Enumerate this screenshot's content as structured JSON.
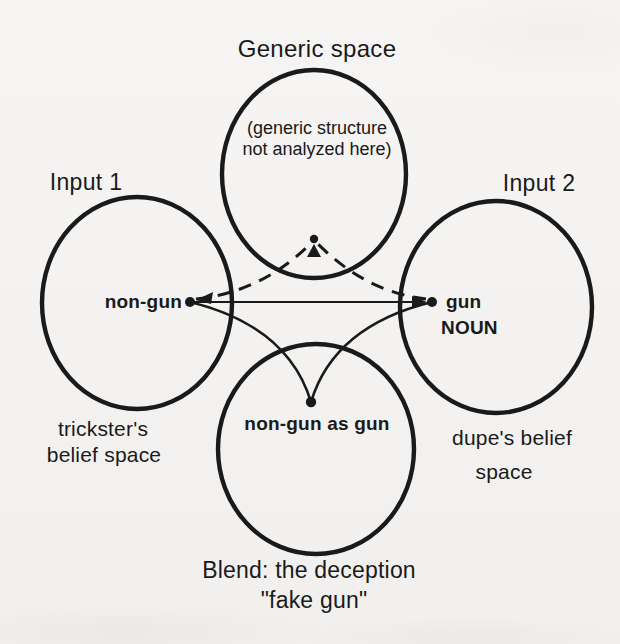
{
  "figure": {
    "background_color": "#f4f3f1",
    "ink_color": "#1a1a1a",
    "generic_space": {
      "title": "Generic space",
      "note_line1": "(generic structure",
      "note_line2": "not analyzed here)"
    },
    "input1": {
      "title": "Input 1",
      "point_label": "non-gun",
      "caption_line1": "trickster's",
      "caption_line2": "belief space"
    },
    "input2": {
      "title": "Input 2",
      "point_label": "gun",
      "point_sublabel": "NOUN",
      "caption_line1": "dupe's belief",
      "caption_line2": "space"
    },
    "blend": {
      "point_label": "non-gun as gun",
      "caption_line1": "Blend: the deception",
      "caption_line2": "\"fake gun\""
    },
    "connections": [
      {
        "from": "non-gun",
        "to": "generic-point",
        "style": "dashed",
        "arrow": "both-ends"
      },
      {
        "from": "gun",
        "to": "generic-point",
        "style": "dashed",
        "arrow": "both-ends"
      },
      {
        "from": "non-gun",
        "to": "gun",
        "style": "solid",
        "arrow": "at-gun"
      },
      {
        "from": "non-gun",
        "to": "non-gun as gun",
        "style": "curved",
        "arrow": "none"
      },
      {
        "from": "gun",
        "to": "non-gun as gun",
        "style": "curved",
        "arrow": "none"
      }
    ]
  }
}
